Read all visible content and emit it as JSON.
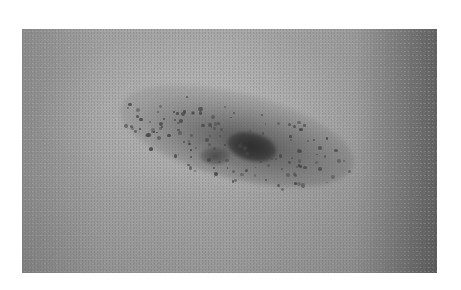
{
  "image": {
    "subject": "grayscale close-up photograph of a pigmented skin lesion",
    "background_color": "#ffffff",
    "photo_bounds": {
      "x": 22,
      "y": 29,
      "width": 415,
      "height": 244
    },
    "colors": {
      "skin_light": "#a8a8a8",
      "skin_edge_dark": "#5e5e5e",
      "lesion_dots": "#444444",
      "lesion_core": "#2e2e2e"
    }
  }
}
